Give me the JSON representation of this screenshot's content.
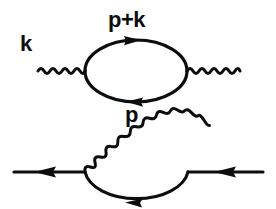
{
  "figure": {
    "kind": "feynman-diagrams",
    "background_color": "#ffffff",
    "ink_color": "#0d0d0d",
    "width": 276,
    "height": 209,
    "diagrams": [
      {
        "name": "photon-self-energy",
        "description": "Photon self-energy: wavy photon line in, fermion loop, wavy photon line out",
        "labels": [
          {
            "id": "k",
            "text": "k",
            "x": 20,
            "y": 33
          },
          {
            "id": "p_k",
            "text": "p+k",
            "x": 108,
            "y": 9
          },
          {
            "id": "p",
            "text": "p",
            "x": 125,
            "y": 104
          }
        ],
        "loop": {
          "cx": 136,
          "cy": 71,
          "rx": 51,
          "ry": 31
        },
        "photon_in": {
          "x1": 38,
          "x2": 85,
          "y": 71
        },
        "photon_out": {
          "x1": 187,
          "x2": 240,
          "y": 71
        },
        "arrows": [
          {
            "on": "top-arc",
            "direction": "right",
            "x": 134,
            "y": 40.5
          },
          {
            "on": "bottom-arc",
            "direction": "left",
            "x": 134,
            "y": 101.5
          }
        ]
      },
      {
        "name": "electron-self-energy",
        "description": "Electron self-energy: fermion line in, photon arc over fermion loop arc, fermion line out",
        "labels": [],
        "loop": {
          "cx": 136,
          "cy": 172,
          "rx": 52,
          "ry": 31
        },
        "fermion_in": {
          "x1": 14,
          "x2": 85,
          "y": 172
        },
        "fermion_out": {
          "x1": 188,
          "x2": 263,
          "y": 172
        },
        "arrows": [
          {
            "on": "incoming-line",
            "direction": "left",
            "x": 48,
            "y": 172
          },
          {
            "on": "outgoing-line",
            "direction": "left",
            "x": 228,
            "y": 172
          },
          {
            "on": "bottom-arc",
            "direction": "left",
            "x": 133,
            "y": 202
          }
        ]
      }
    ]
  }
}
